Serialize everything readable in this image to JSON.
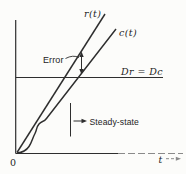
{
  "figure": {
    "curves": {
      "input_label": "r(t)",
      "output_label": "c(t)"
    },
    "annotations": {
      "error": "Error",
      "equal_slopes": "Dr = Dc",
      "steady_state": "Steady-state"
    },
    "axes": {
      "origin": "0",
      "time": "t"
    },
    "colors": {
      "ink": "#2e2e2e",
      "faded_ink": "#8a8a8a",
      "background": "#fcfcfa"
    }
  }
}
